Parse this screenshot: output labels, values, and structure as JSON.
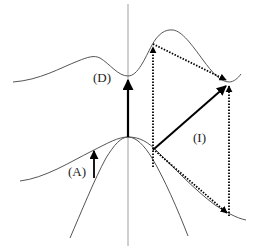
{
  "diagram": {
    "type": "band-structure-transitions",
    "labels": {
      "direct": "(D)",
      "auger": "(A)",
      "indirect": "(I)"
    },
    "colors": {
      "curve": "#555555",
      "axis": "#888888",
      "arrow": "#000000",
      "text": "#222222",
      "background": "#ffffff"
    },
    "elements": [
      {
        "id": "conduction-band",
        "kind": "curve",
        "description": "upper band with minimum at center and side valley"
      },
      {
        "id": "light-valence-band",
        "kind": "curve",
        "description": "broad valence band peaked at center"
      },
      {
        "id": "heavy-valence-band",
        "kind": "curve",
        "description": "narrow valence band peaked at center"
      },
      {
        "id": "k-axis",
        "kind": "line",
        "description": "vertical line at zone center"
      },
      {
        "id": "direct-transition",
        "kind": "solid-arrow",
        "label": "(D)"
      },
      {
        "id": "intraband-transition",
        "kind": "solid-arrow",
        "label": "(A)"
      },
      {
        "id": "indirect-transition",
        "kind": "solid-arrow",
        "label": "(I)"
      },
      {
        "id": "two-step-path-upper",
        "kind": "dotted-arrows"
      },
      {
        "id": "two-step-path-lower",
        "kind": "dotted-arrows"
      }
    ]
  }
}
